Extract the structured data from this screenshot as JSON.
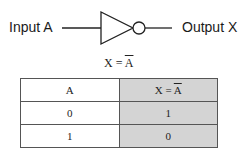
{
  "diagram": {
    "input_label": "Input A",
    "output_label": "Output X",
    "gate_type": "NOT",
    "equation": {
      "lhs": "X = ",
      "rhs": "A"
    }
  },
  "truth_table": {
    "headers": {
      "a": "A",
      "x_lhs": "X = ",
      "x_rhs": "A"
    },
    "rows": [
      {
        "a": "0",
        "x": "1"
      },
      {
        "a": "1",
        "x": "0"
      }
    ],
    "colors": {
      "output_column_bg": "#d4d4d4",
      "border": "#555555"
    }
  }
}
